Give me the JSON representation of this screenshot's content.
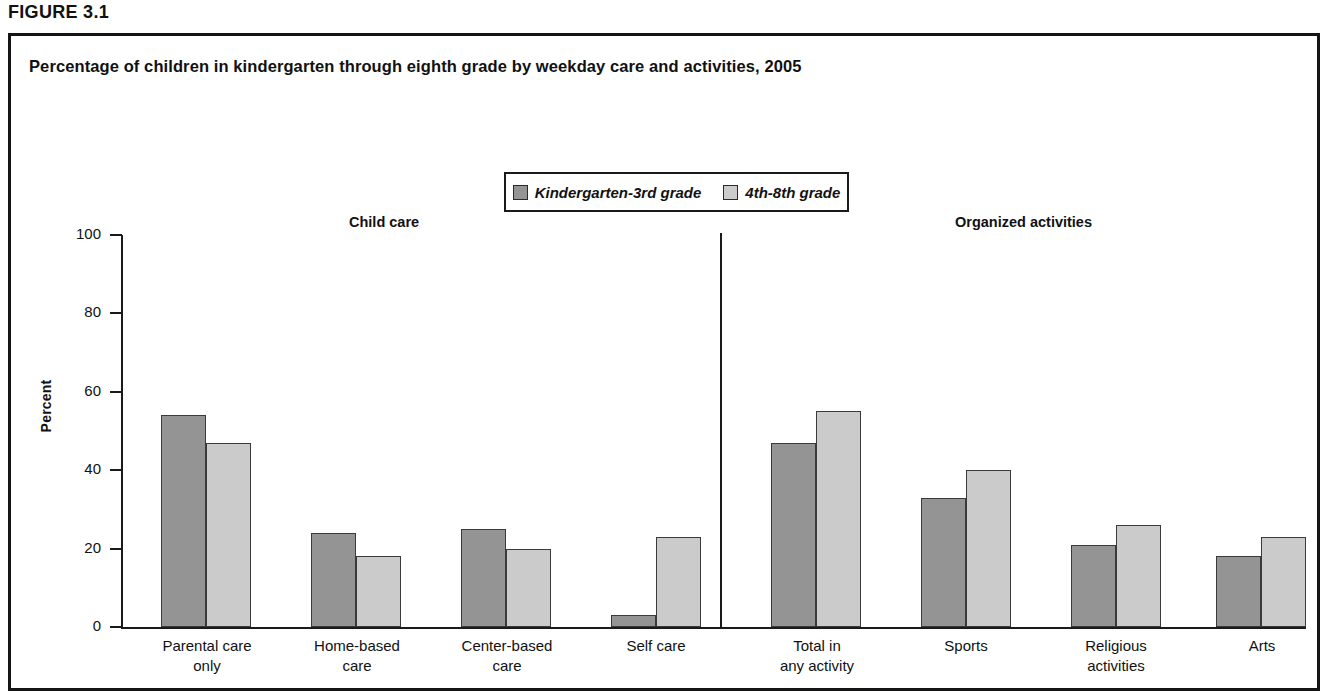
{
  "figure": {
    "label": "FIGURE 3.1",
    "title": "Percentage of children in kindergarten through eighth grade by weekday care and activities, 2005"
  },
  "legend": {
    "items": [
      {
        "label": "Kindergarten-3rd grade",
        "color": "#949494"
      },
      {
        "label": "4th-8th grade",
        "color": "#cbcbcb"
      }
    ]
  },
  "sections": [
    {
      "heading": "Child care"
    },
    {
      "heading": "Organized activities"
    }
  ],
  "axis": {
    "y_title": "Percent",
    "y_ticks": [
      "100",
      "80",
      "60",
      "40",
      "20",
      "0"
    ]
  },
  "chart_data": {
    "type": "bar",
    "title": "Percentage of children in kindergarten through eighth grade by weekday care and activities, 2005",
    "xlabel": "",
    "ylabel": "Percent",
    "ylim": [
      0,
      100
    ],
    "yticks": [
      0,
      20,
      40,
      60,
      80,
      100
    ],
    "grid": false,
    "legend_position": "top-center",
    "categories": [
      "Parental care\nonly",
      "Home-based\ncare",
      "Center-based\ncare",
      "Self care",
      "Total in\nany activity",
      "Sports",
      "Religious\nactivities",
      "Arts"
    ],
    "group_labels": [
      "Child care",
      "Organized activities"
    ],
    "group_membership": [
      0,
      0,
      0,
      0,
      1,
      1,
      1,
      1
    ],
    "series": [
      {
        "name": "Kindergarten-3rd grade",
        "color": "#949494",
        "values": [
          54,
          24,
          25,
          3,
          47,
          33,
          21,
          18
        ]
      },
      {
        "name": "4th-8th grade",
        "color": "#cbcbcb",
        "values": [
          47,
          18,
          20,
          23,
          55,
          40,
          26,
          23
        ]
      }
    ]
  },
  "layout": {
    "bar_width": 45,
    "group_starts": [
      150,
      300,
      450,
      600,
      760,
      910,
      1060,
      1205
    ],
    "label_centers": [
      196,
      346,
      496,
      645,
      806,
      955,
      1105,
      1251
    ],
    "heading_positions": [
      {
        "text_index": 0,
        "left": 338
      },
      {
        "text_index": 1,
        "left": 944
      }
    ]
  }
}
